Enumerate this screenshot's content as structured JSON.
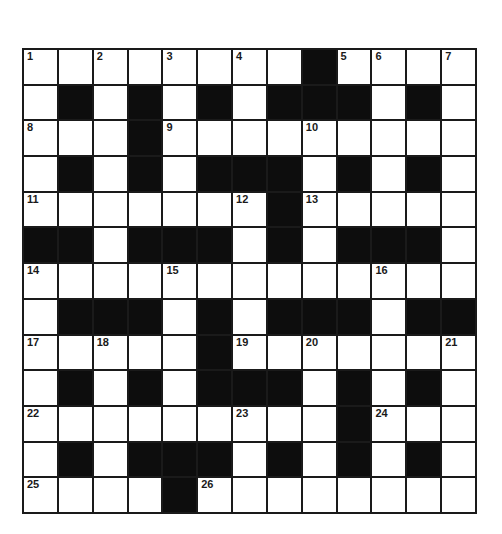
{
  "puzzle": {
    "type": "crossword",
    "rows": 13,
    "cols": 13,
    "colors": {
      "black_cell": "#0d0d0d",
      "white_cell": "#ffffff",
      "grid_line": "#1a1a1a"
    },
    "layout": [
      "W W W W W W W W B W W W W",
      "W B W B W B W B B B W B W",
      "W W W B W W W W W W W W W",
      "W B W B W B B B W B W B W",
      "W W W W W W W B W W W W W",
      "B B W B B B W B W B B B W",
      "W W W W W W W W W W W W W",
      "W B B B W B W B B B W B B",
      "W W W W W B W W W W W W W",
      "W B W B W B B B W B W B W",
      "W W W W W W W W W B W W W",
      "W B W B B B W B W B W B W",
      "W W W W B W W W W W W W W"
    ],
    "numbers": [
      {
        "row": 0,
        "col": 0,
        "n": "1"
      },
      {
        "row": 0,
        "col": 2,
        "n": "2"
      },
      {
        "row": 0,
        "col": 4,
        "n": "3"
      },
      {
        "row": 0,
        "col": 6,
        "n": "4"
      },
      {
        "row": 0,
        "col": 9,
        "n": "5"
      },
      {
        "row": 0,
        "col": 10,
        "n": "6"
      },
      {
        "row": 0,
        "col": 12,
        "n": "7"
      },
      {
        "row": 2,
        "col": 0,
        "n": "8"
      },
      {
        "row": 2,
        "col": 4,
        "n": "9"
      },
      {
        "row": 2,
        "col": 8,
        "n": "10"
      },
      {
        "row": 4,
        "col": 0,
        "n": "11"
      },
      {
        "row": 4,
        "col": 6,
        "n": "12"
      },
      {
        "row": 4,
        "col": 8,
        "n": "13"
      },
      {
        "row": 6,
        "col": 0,
        "n": "14"
      },
      {
        "row": 6,
        "col": 4,
        "n": "15"
      },
      {
        "row": 6,
        "col": 10,
        "n": "16"
      },
      {
        "row": 8,
        "col": 0,
        "n": "17"
      },
      {
        "row": 8,
        "col": 2,
        "n": "18"
      },
      {
        "row": 8,
        "col": 6,
        "n": "19"
      },
      {
        "row": 8,
        "col": 8,
        "n": "20"
      },
      {
        "row": 8,
        "col": 12,
        "n": "21"
      },
      {
        "row": 10,
        "col": 0,
        "n": "22"
      },
      {
        "row": 10,
        "col": 6,
        "n": "23"
      },
      {
        "row": 10,
        "col": 10,
        "n": "24"
      },
      {
        "row": 12,
        "col": 0,
        "n": "25"
      },
      {
        "row": 12,
        "col": 5,
        "n": "26"
      }
    ]
  }
}
